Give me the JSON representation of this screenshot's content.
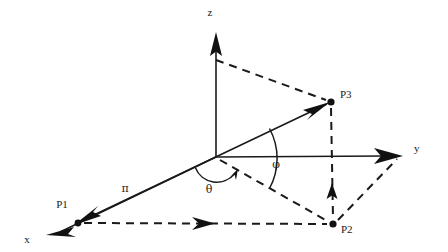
{
  "figure": {
    "background_color": "#ffffff",
    "line_color": "#1a1a1a"
  },
  "axes": {
    "z": {
      "label": "z",
      "label_x": 210,
      "label_y": 16,
      "origin_x": 216,
      "origin_y": 157,
      "tip_x": 216,
      "tip_y": 32
    },
    "y": {
      "label": "y",
      "label_x": 414,
      "label_y": 152,
      "origin_x": 216,
      "origin_y": 157,
      "tip_x": 403,
      "tip_y": 156
    },
    "x": {
      "label": "x",
      "label_x": 27,
      "label_y": 243,
      "origin_x": 216,
      "origin_y": 157,
      "tip_x": 46,
      "tip_y": 235
    }
  },
  "points": [
    {
      "name": "P1",
      "label": "P1",
      "x": 78,
      "y": 223,
      "label_x": 62,
      "label_y": 208
    },
    {
      "name": "P2",
      "label": "P2",
      "x": 333,
      "y": 224,
      "label_x": 341,
      "label_y": 233
    },
    {
      "name": "P3",
      "label": "P3",
      "x": 331,
      "y": 102,
      "label_x": 340,
      "label_y": 98
    }
  ],
  "angles": [
    {
      "name": "theta",
      "label": "θ",
      "label_x": 209,
      "label_y": 193,
      "radius": 22
    },
    {
      "name": "phi",
      "label": "φ",
      "label_x": 276,
      "label_y": 168,
      "radius": 62
    }
  ],
  "vectors": [
    {
      "name": "radius-vector",
      "label": "π",
      "label_x": 125,
      "label_y": 192,
      "from": "P1",
      "to": "P3",
      "style": "solid-double-arrow"
    }
  ],
  "dashed_connections": [
    {
      "name": "z-axis-to-P3",
      "from_x": 216,
      "from_y": 60,
      "to_x": 331,
      "to_y": 102
    },
    {
      "name": "P3-to-P2-vertical",
      "from_x": 331,
      "from_y": 102,
      "to_x": 333,
      "to_y": 224
    },
    {
      "name": "origin-to-P2",
      "from_x": 216,
      "from_y": 157,
      "to_x": 333,
      "to_y": 224
    },
    {
      "name": "P1-to-P2-horizontal",
      "from_x": 78,
      "from_y": 223,
      "to_x": 333,
      "to_y": 224
    },
    {
      "name": "P2-to-y-axis",
      "from_x": 333,
      "from_y": 224,
      "to_x": 396,
      "to_y": 160
    }
  ]
}
